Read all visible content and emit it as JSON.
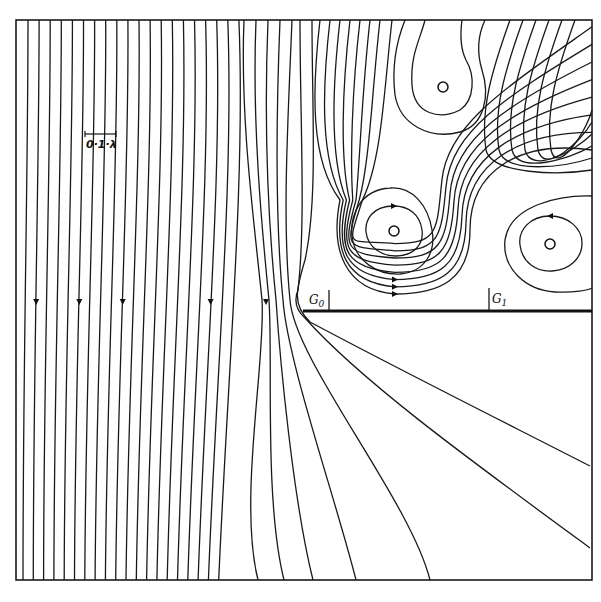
{
  "figure": {
    "type": "streamline diagram",
    "scale_bar": {
      "label": "0·1·λ"
    },
    "labels": {
      "g0": "G",
      "g0_sub": "0",
      "g1": "G",
      "g1_sub": "1"
    },
    "plate": {
      "from_x": 303,
      "to_x": 592,
      "y": 311
    },
    "vortices": [
      {
        "name": "upper-vortex",
        "cx": 443,
        "cy": 87
      },
      {
        "name": "middle-vortex",
        "cx": 394,
        "cy": 231
      },
      {
        "name": "right-vortex",
        "cx": 550,
        "cy": 244
      }
    ],
    "flow_direction": "downward",
    "frame": {
      "x": 16,
      "y": 20,
      "width": 576,
      "height": 560
    },
    "stroke_color": "#1a1a1a",
    "background_color": "#ffffff"
  }
}
